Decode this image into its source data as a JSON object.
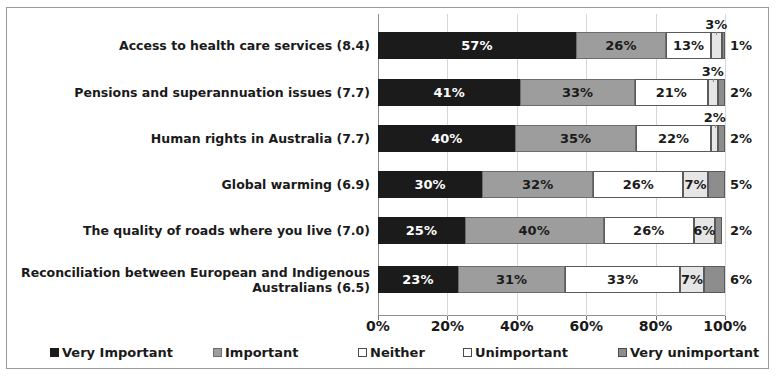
{
  "chart_data": {
    "type": "bar",
    "subtype": "stacked-horizontal-100pct",
    "title": "",
    "xlabel": "",
    "ylabel": "",
    "xlim": [
      0,
      100
    ],
    "xticks": [
      "0%",
      "20%",
      "40%",
      "60%",
      "80%",
      "100%"
    ],
    "xtick_values": [
      0,
      20,
      40,
      60,
      80,
      100
    ],
    "grid": true,
    "legend_position": "bottom",
    "categories": [
      "Access to health care services (8.4)",
      "Pensions and superannuation issues (7.7)",
      "Human rights in Australia (7.7)",
      "Global warming (6.9)",
      "The quality of roads where you live (7.0)",
      "Reconciliation between European and Indigenous Australians (6.5)"
    ],
    "series": [
      {
        "name": "Very Important",
        "color": "#1b1b1b",
        "values": [
          57,
          41,
          40,
          30,
          25,
          23
        ]
      },
      {
        "name": "Important",
        "color": "#9d9d9d",
        "values": [
          26,
          33,
          35,
          32,
          40,
          31
        ]
      },
      {
        "name": "Neither",
        "color": "#ffffff",
        "values": [
          13,
          21,
          22,
          26,
          26,
          33
        ]
      },
      {
        "name": "Unimportant",
        "color": "#e6e6e6",
        "values": [
          3,
          3,
          2,
          7,
          6,
          7
        ]
      },
      {
        "name": "Very unimportant",
        "color": "#8d8d8d",
        "values": [
          1,
          2,
          2,
          5,
          2,
          6
        ]
      }
    ],
    "value_labels": [
      [
        "57%",
        "26%",
        "13%",
        "3%",
        "1%"
      ],
      [
        "41%",
        "33%",
        "21%",
        "3%",
        "2%"
      ],
      [
        "40%",
        "35%",
        "22%",
        "2%",
        "2%"
      ],
      [
        "30%",
        "32%",
        "26%",
        "7%",
        "5%"
      ],
      [
        "25%",
        "40%",
        "26%",
        "6%",
        "2%"
      ],
      [
        "23%",
        "31%",
        "33%",
        "7%",
        "6%"
      ]
    ]
  },
  "legend": {
    "items": [
      {
        "label": "Very Important"
      },
      {
        "label": "Important"
      },
      {
        "label": "Neither"
      },
      {
        "label": "Unimportant"
      },
      {
        "label": "Very unimportant"
      }
    ]
  }
}
